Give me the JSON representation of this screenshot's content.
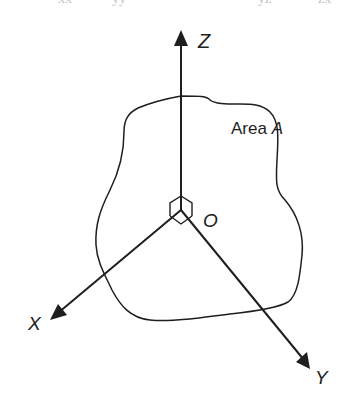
{
  "diagram": {
    "colors": {
      "background": "#ffffff",
      "stroke": "#1e1e1e"
    },
    "origin": {
      "label": "O",
      "x": 181,
      "y": 210
    },
    "axes": [
      {
        "name": "Z",
        "label": "Z",
        "tip": [
          181,
          33
        ],
        "label_pos": [
          198,
          32
        ]
      },
      {
        "name": "X",
        "label": "X",
        "tip": [
          52,
          318
        ],
        "label_pos": [
          28,
          314
        ]
      },
      {
        "name": "Y",
        "label": "Y",
        "tip": [
          310,
          368
        ],
        "label_pos": [
          315,
          368
        ]
      }
    ],
    "area": {
      "label_prefix": "Area ",
      "label_var": "A",
      "label_pos": [
        231,
        120
      ]
    },
    "top_fragments": [
      "xx",
      "yy",
      "yz",
      "zx"
    ]
  }
}
